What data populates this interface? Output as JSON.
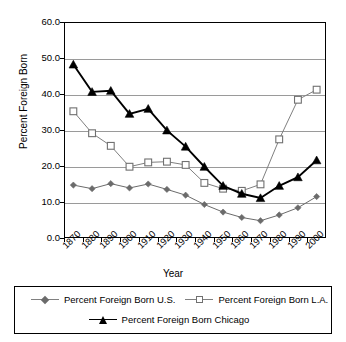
{
  "chart_data": {
    "type": "line",
    "title": "",
    "xlabel": "Year",
    "ylabel": "Percent Foreign Born",
    "grid": true,
    "legend_position": "bottom",
    "ylim": [
      0.0,
      60.0
    ],
    "ytick_labels": [
      "0.0",
      "10.0",
      "20.0",
      "30.0",
      "40.0",
      "50.0",
      "60.0"
    ],
    "ytick_values": [
      0.0,
      10.0,
      20.0,
      30.0,
      40.0,
      50.0,
      60.0
    ],
    "xtick_labels": [
      "1870",
      "1880",
      "1890",
      "1900",
      "1910",
      "1920",
      "1930",
      "1940",
      "1950",
      "1960",
      "1970",
      "1980",
      "1990",
      "2000"
    ],
    "x": [
      1880,
      1890,
      1900,
      1910,
      1920,
      1930,
      1940,
      1950,
      1960,
      1970,
      1980,
      1990,
      2000,
      2005
    ],
    "series": [
      {
        "name": "Percent Foreign Born U.S.",
        "marker": "diamond",
        "color": "#6b6b6b",
        "values": [
          14.7,
          13.7,
          15.1,
          13.9,
          15.0,
          13.5,
          11.9,
          9.3,
          7.2,
          5.7,
          4.8,
          6.4,
          8.4,
          11.5
        ]
      },
      {
        "name": "Percent Foreign Born L.A.",
        "marker": "square",
        "color": "#808080",
        "values": [
          35.2,
          29.1,
          25.6,
          19.8,
          21.0,
          21.2,
          20.3,
          15.3,
          13.7,
          13.1,
          14.9,
          27.4,
          38.4,
          41.2
        ]
      },
      {
        "name": "Percent Foreign Born Chicago",
        "marker": "triangle",
        "color": "#000000",
        "values": [
          48.2,
          40.6,
          40.9,
          34.5,
          35.9,
          29.9,
          25.4,
          19.8,
          14.5,
          12.3,
          11.1,
          14.5,
          16.9,
          21.6
        ]
      }
    ]
  },
  "legend": {
    "items": [
      {
        "label": "Percent Foreign Born U.S.",
        "marker": "diamond"
      },
      {
        "label": "Percent Foreign Born L.A.",
        "marker": "square"
      },
      {
        "label": "Percent Foreign Born Chicago",
        "marker": "triangle"
      }
    ]
  }
}
